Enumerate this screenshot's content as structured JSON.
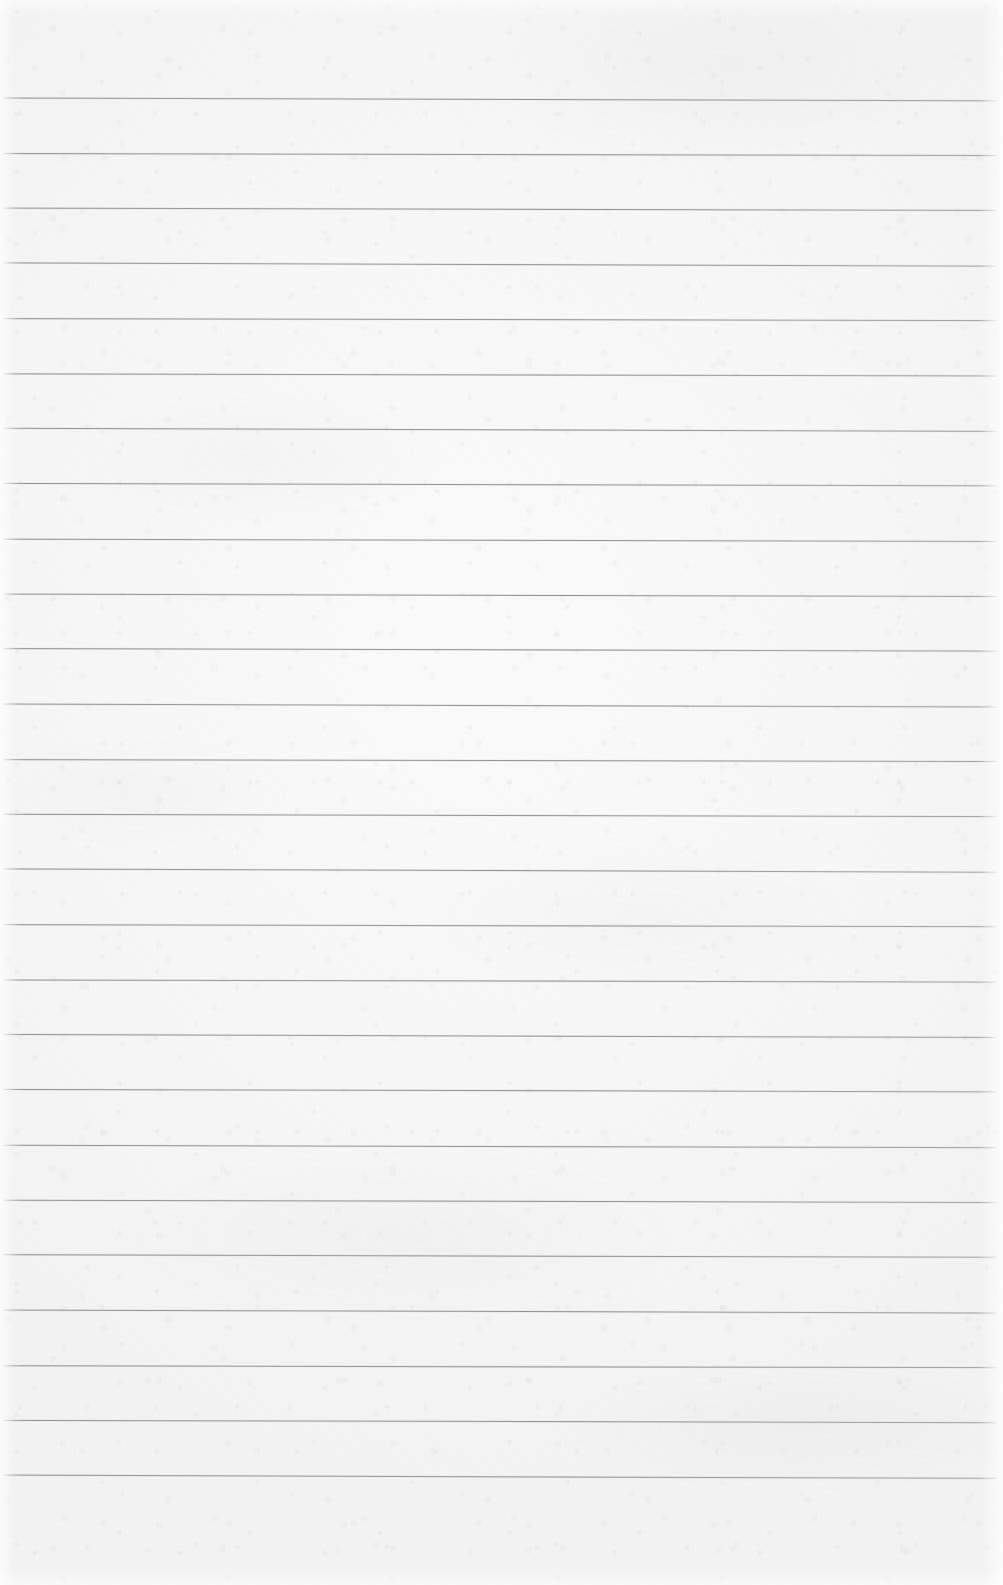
{
  "document": {
    "kind": "scanned-lined-notebook-paper",
    "content_text": "",
    "handwriting_present": false,
    "printed_text_present": false
  },
  "page": {
    "width": 1003,
    "height": 1585,
    "paper_color": "#f7f7f7",
    "paper_highlight_color": "#fbfbfb",
    "paper_shadow_color": "#f2f2f2",
    "background_color": "#ffffff"
  },
  "ruling": {
    "style": "wide-ruled horizontal lines",
    "line_color": "#9b9b9b",
    "line_thickness_px": 1,
    "line_count": 26,
    "first_line_y": 98,
    "line_spacing_px": 55.1,
    "line_start_x": 4,
    "line_end_x": 996,
    "slope_drop_px": 2.5,
    "margin_rule_present": false,
    "top_margin_px": 98,
    "bottom_margin_px": 110,
    "line_y_positions": [
      98,
      153.1,
      208.2,
      263.3,
      318.4,
      373.5,
      428.6,
      483.7,
      538.8,
      593.9,
      649.0,
      704.1,
      759.2,
      814.3,
      869.4,
      924.5,
      979.6,
      1034.7,
      1089.8,
      1144.9,
      1200.0,
      1255.1,
      1310.2,
      1365.3,
      1420.4,
      1475.5
    ]
  }
}
